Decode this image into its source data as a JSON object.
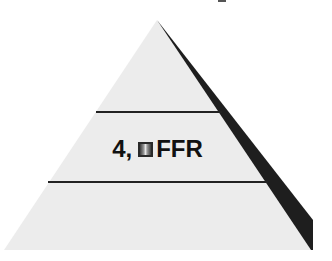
{
  "diagram": {
    "type": "pyramid",
    "tiers": 3,
    "colors": {
      "face": "#ececec",
      "side": "#1e1e1e",
      "divider": "#222222",
      "text": "#111111"
    },
    "middle_tier": {
      "prefix": "4,",
      "icon": "gradient-square-icon",
      "suffix": "FFR"
    }
  }
}
